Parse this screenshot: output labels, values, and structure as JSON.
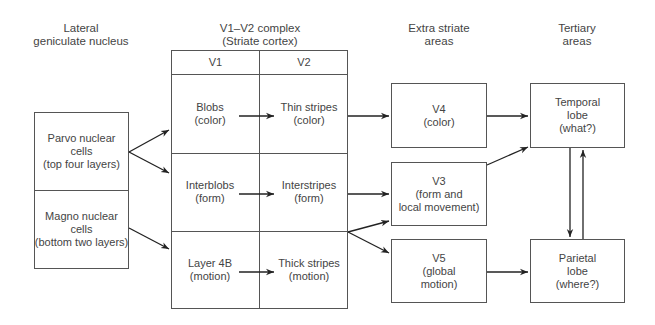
{
  "columns": {
    "lgn": "Lateral\ngeniculate nucleus",
    "v1v2": "V1–V2 complex\n(Striate cortex)",
    "extrastriate": "Extra striate\nareas",
    "tertiary": "Tertiary\nareas"
  },
  "lgn": {
    "parvo": "Parvo nuclear\ncells\n(top four layers)",
    "magno": "Magno nuclear\ncells\n(bottom two layers)"
  },
  "v1v2": {
    "headers": [
      "V1",
      "V2"
    ],
    "rows": [
      {
        "v1": "Blobs\n(color)",
        "v2": "Thin stripes\n(color)"
      },
      {
        "v1": "Interblobs\n(form)",
        "v2": "Interstripes\n(form)"
      },
      {
        "v1": "Layer 4B\n(motion)",
        "v2": "Thick stripes\n(motion)"
      }
    ]
  },
  "extrastriate": {
    "v4": "V4\n(color)",
    "v3": "V3\n(form and\nlocal movement)",
    "v5": "V5\n(global\nmotion)"
  },
  "tertiary": {
    "temporal": "Temporal\nlobe\n(what?)",
    "parietal": "Parietal\nlobe\n(where?)"
  },
  "colors": {
    "line": "#555555",
    "arrow": "#222222",
    "text": "#444444"
  }
}
